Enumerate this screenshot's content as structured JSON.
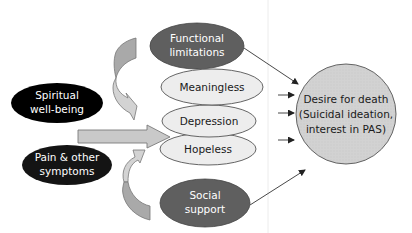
{
  "diagram": {
    "type": "conceptual-model",
    "nodes": {
      "spiritual": {
        "line1": "Spiritual",
        "line2": "well-being",
        "fill": "#000000"
      },
      "pain": {
        "line1": "Pain & other",
        "line2": "symptoms",
        "fill": "#111111"
      },
      "functional": {
        "line1": "Functional",
        "line2": "limitations",
        "fill": "#5f5f5f"
      },
      "meaningless": {
        "label": "Meaningless",
        "fill": "#ececec"
      },
      "depression": {
        "label": "Depression",
        "fill": "#ececec"
      },
      "hopeless": {
        "label": "Hopeless",
        "fill": "#ececec"
      },
      "social": {
        "line1": "Social",
        "line2": "support",
        "fill": "#5f5f5f"
      },
      "outcome": {
        "line1": "Desire for death",
        "line2": "(Suicidal ideation,",
        "line3": "interest in PAS)",
        "fill": "#d4d4d4"
      }
    },
    "edges": [
      {
        "from": "spiritual",
        "to": "mediators",
        "style": "block-arrow"
      },
      {
        "from": "pain",
        "to": "mediators",
        "style": "block-arrow"
      },
      {
        "from": "functional",
        "to": "mediators",
        "style": "curved-block-arrow"
      },
      {
        "from": "social",
        "to": "mediators",
        "style": "curved-block-arrow"
      },
      {
        "from": "functional",
        "to": "outcome",
        "style": "line-arrow"
      },
      {
        "from": "meaningless",
        "to": "outcome",
        "style": "line-arrow"
      },
      {
        "from": "depression",
        "to": "outcome",
        "style": "line-arrow"
      },
      {
        "from": "hopeless",
        "to": "outcome",
        "style": "line-arrow"
      },
      {
        "from": "social",
        "to": "outcome",
        "style": "line-arrow"
      }
    ],
    "colors": {
      "block_arrow_fill": "#c9c9c9",
      "block_arrow_stroke": "#7a7a7a",
      "curved_upper_fill": "#a8a8a8",
      "curved_lower_fill": "#cfcfcf",
      "line_color": "#333333",
      "divider": "#e6e6e6"
    }
  }
}
